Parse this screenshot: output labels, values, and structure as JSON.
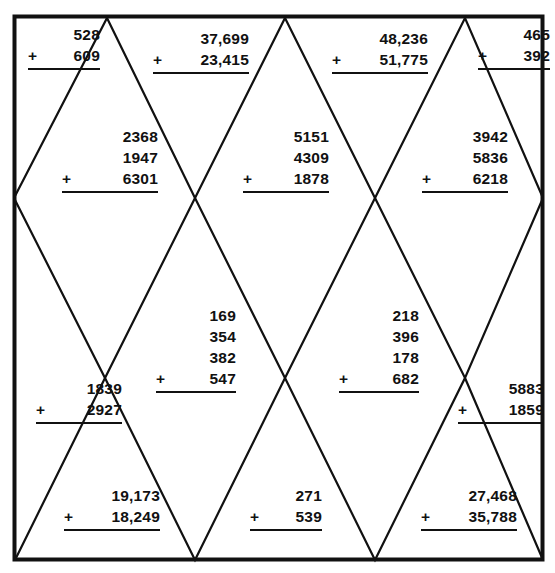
{
  "page": {
    "background_color": "#ffffff",
    "border_color": "#111111",
    "line_color": "#111111",
    "text_color": "#111111"
  },
  "worksheet": {
    "type": "addition-practice",
    "problem_count": 12,
    "problems": [
      {
        "id": "p1",
        "cell": "top-left-triangle",
        "operator": "+",
        "addends": [
          "528",
          "609"
        ],
        "left": 28,
        "top": 24,
        "width_class": "p-w72"
      },
      {
        "id": "p2",
        "cell": "top-row-diamond-1",
        "operator": "+",
        "addends": [
          "37,699",
          "23,415"
        ],
        "left": 153,
        "top": 28,
        "width_class": "p-w96"
      },
      {
        "id": "p3",
        "cell": "top-row-diamond-2",
        "operator": "+",
        "addends": [
          "48,236",
          "51,775"
        ],
        "left": 332,
        "top": 28,
        "width_class": "p-w96"
      },
      {
        "id": "p4",
        "cell": "top-right-triangle",
        "operator": "+",
        "addends": [
          "465",
          "392"
        ],
        "left": 478,
        "top": 24,
        "width_class": "p-w72"
      },
      {
        "id": "p5",
        "cell": "row1-diamond-left",
        "operator": "+",
        "addends": [
          "2368",
          "1947",
          "6301"
        ],
        "left": 62,
        "top": 126,
        "width_class": "p-w96"
      },
      {
        "id": "p6",
        "cell": "row1-diamond-center",
        "operator": "+",
        "addends": [
          "5151",
          "4309",
          "1878"
        ],
        "left": 243,
        "top": 126,
        "width_class": "p-w86"
      },
      {
        "id": "p7",
        "cell": "row1-diamond-right",
        "operator": "+",
        "addends": [
          "3942",
          "5836",
          "6218"
        ],
        "left": 422,
        "top": 126,
        "width_class": "p-w86"
      },
      {
        "id": "p8",
        "cell": "row2-left-edge-triangle",
        "operator": "+",
        "addends": [
          "1839",
          "2927"
        ],
        "left": 36,
        "top": 378,
        "width_class": "p-w86"
      },
      {
        "id": "p9",
        "cell": "row2-diamond-center-left",
        "operator": "+",
        "addends": [
          "169",
          "354",
          "382",
          "547"
        ],
        "left": 156,
        "top": 305,
        "width_class": "p-w80"
      },
      {
        "id": "p10",
        "cell": "row2-diamond-center-right",
        "operator": "+",
        "addends": [
          "218",
          "396",
          "178",
          "682"
        ],
        "left": 339,
        "top": 305,
        "width_class": "p-w80"
      },
      {
        "id": "p11",
        "cell": "row2-right-edge-triangle",
        "operator": "+",
        "addends": [
          "5883",
          "1859"
        ],
        "left": 458,
        "top": 378,
        "width_class": "p-w86"
      },
      {
        "id": "p12",
        "cell": "bottom-triangle-1",
        "operator": "+",
        "addends": [
          "19,173",
          "18,249"
        ],
        "left": 64,
        "top": 485,
        "width_class": "p-w96"
      },
      {
        "id": "p13",
        "cell": "bottom-triangle-2",
        "operator": "+",
        "addends": [
          "271",
          "539"
        ],
        "left": 250,
        "top": 485,
        "width_class": "p-w72"
      },
      {
        "id": "p14",
        "cell": "bottom-triangle-3",
        "operator": "+",
        "addends": [
          "27,468",
          "35,788"
        ],
        "left": 421,
        "top": 485,
        "width_class": "p-w96"
      }
    ]
  },
  "lattice": {
    "description": "zigzag diamond lattice",
    "border": {
      "x1": 13,
      "y1": 15,
      "x2": 543,
      "y2": 560
    },
    "peaks_top": [
      107,
      285,
      465
    ],
    "vertices_row1_y": 198,
    "vertices_row1_x": [
      14,
      195,
      375,
      543
    ],
    "vertices_row2_y": 378,
    "vertices_row2_x": [
      105,
      285,
      465
    ],
    "vertices_bottom_y": 560,
    "vertices_bottom_x": [
      15,
      195,
      375,
      543
    ]
  }
}
